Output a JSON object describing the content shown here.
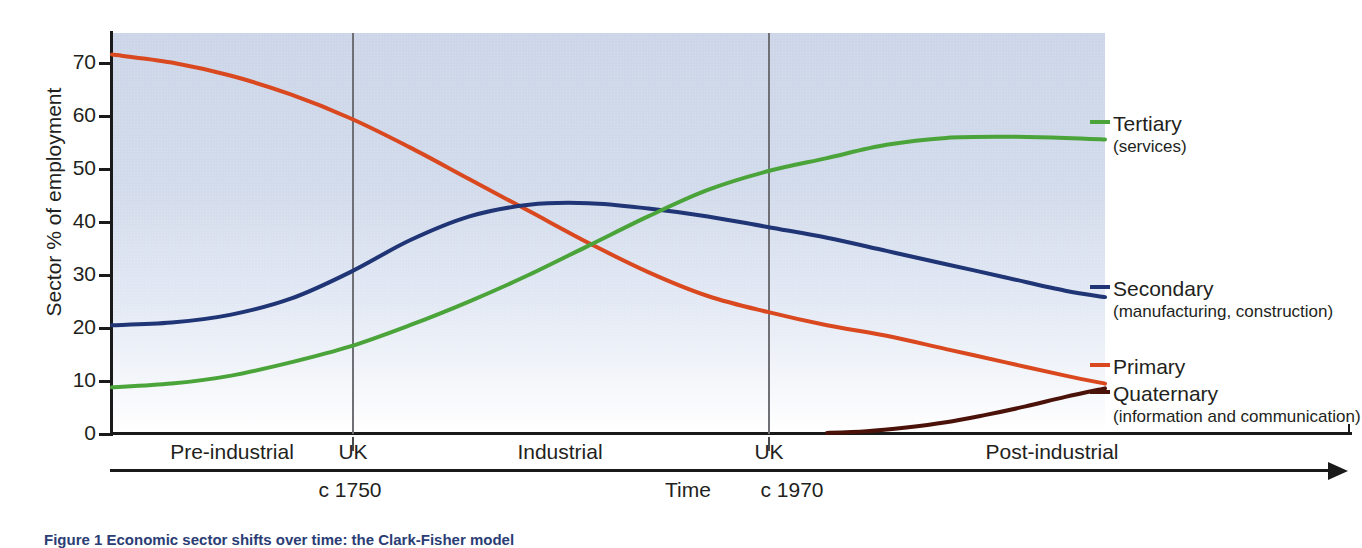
{
  "chart_data": {
    "type": "line",
    "xlabel": "Time",
    "ylabel": "Sector % of employment",
    "ylim": [
      0,
      75
    ],
    "yticks": [
      0,
      10,
      20,
      30,
      40,
      50,
      60,
      70
    ],
    "grid": false,
    "legend_position": "right",
    "x_categories": [
      "Pre-industrial",
      "UK",
      "Industrial",
      "UK",
      "Post-industrial"
    ],
    "x_markers": [
      {
        "label": "UK",
        "time": "c 1750"
      },
      {
        "label": "UK",
        "time": "c 1970"
      }
    ],
    "series": [
      {
        "name": "Primary",
        "sub": "",
        "color": "#d9481f",
        "x": [
          0,
          6,
          12,
          18,
          24,
          30,
          36,
          42,
          48,
          54,
          60,
          66,
          72,
          78,
          84,
          90,
          96,
          100
        ],
        "values": [
          71.5,
          70.0,
          67.5,
          64.0,
          59.5,
          54.0,
          48.0,
          42.0,
          36.0,
          30.5,
          26.0,
          23.0,
          20.5,
          18.5,
          16.0,
          13.5,
          11.0,
          9.5
        ]
      },
      {
        "name": "Secondary",
        "sub": "(manufacturing, construction)",
        "color": "#1f3575",
        "x": [
          0,
          6,
          12,
          18,
          24,
          30,
          36,
          42,
          48,
          54,
          60,
          66,
          72,
          78,
          84,
          90,
          96,
          100
        ],
        "values": [
          20.5,
          21.0,
          22.5,
          25.5,
          30.5,
          36.5,
          41.0,
          43.2,
          43.5,
          42.5,
          41.0,
          39.0,
          37.0,
          34.5,
          32.0,
          29.5,
          27.0,
          25.8
        ]
      },
      {
        "name": "Tertiary",
        "sub": "(services)",
        "color": "#4aa43a",
        "x": [
          0,
          6,
          12,
          18,
          24,
          30,
          36,
          42,
          48,
          54,
          60,
          66,
          72,
          78,
          84,
          90,
          96,
          100
        ],
        "values": [
          8.8,
          9.5,
          11.0,
          13.5,
          16.5,
          20.5,
          25.0,
          30.0,
          35.5,
          41.0,
          46.0,
          49.5,
          52.0,
          54.5,
          55.8,
          56.0,
          55.8,
          55.5
        ]
      },
      {
        "name": "Quaternary",
        "sub": "(information and communication)",
        "color": "#4a1208",
        "x": [
          72,
          76,
          80,
          84,
          88,
          92,
          96,
          100
        ],
        "values": [
          0.2,
          0.5,
          1.2,
          2.2,
          3.6,
          5.2,
          7.0,
          8.6
        ]
      }
    ]
  },
  "axis": {
    "y_title": "Sector % of employment",
    "y_ticks": [
      "70",
      "60",
      "50",
      "40",
      "30",
      "20",
      "10",
      "0"
    ],
    "time_label": "Time"
  },
  "eras": [
    {
      "label": "Pre-industrial"
    },
    {
      "label": "UK"
    },
    {
      "label": "Industrial"
    },
    {
      "label": "UK"
    },
    {
      "label": "Post-industrial"
    }
  ],
  "time_marks": [
    {
      "label": "c 1750"
    },
    {
      "label": "Time"
    },
    {
      "label": "c 1970"
    }
  ],
  "series_labels": [
    {
      "name": "Tertiary",
      "sub": "(services)"
    },
    {
      "name": "Secondary",
      "sub": "(manufacturing, construction)"
    },
    {
      "name": "Primary",
      "sub": ""
    },
    {
      "name": "Quaternary",
      "sub": "(information and communication)"
    }
  ],
  "caption": "Figure 1  Economic sector shifts over time: the Clark-Fisher model"
}
